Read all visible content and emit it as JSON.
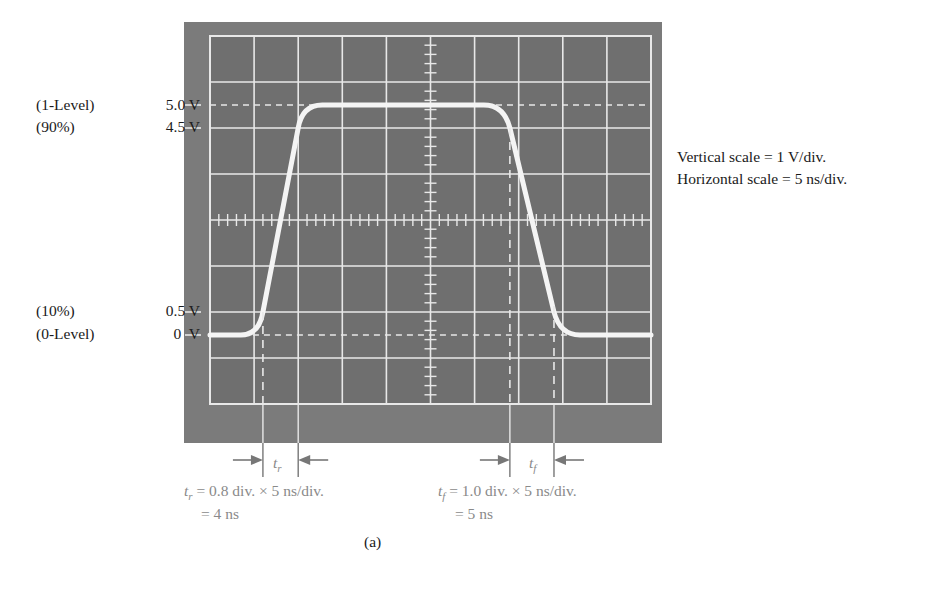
{
  "figure": {
    "caption": "(a)",
    "levels": [
      {
        "percent_label": "(1-Level)",
        "voltage_label": "5.0 V",
        "volts": 5.0
      },
      {
        "percent_label": "(90%)",
        "voltage_label": "4.5 V",
        "volts": 4.5
      },
      {
        "percent_label": "(10%)",
        "voltage_label": "0.5 V",
        "volts": 0.5
      },
      {
        "percent_label": "(0-Level)",
        "voltage_label": "0  V",
        "volts": 0
      }
    ],
    "scale_notes": {
      "vertical": "Vertical scale = 1 V/div.",
      "horizontal": "Horizontal scale = 5 ns/div."
    },
    "rise": {
      "symbol": "t",
      "subscript": "r",
      "formula": "= 0.8 div. × 5 ns/div.",
      "result": "= 4 ns",
      "start_div": 1.2,
      "end_div": 2.0
    },
    "fall": {
      "symbol": "t",
      "subscript": "f",
      "formula": "= 1.0 div. × 5 ns/div.",
      "result": "= 5 ns",
      "start_div": 6.8,
      "end_div": 7.8
    },
    "scope": {
      "h_divisions": 10,
      "v_divisions": 8,
      "volts_per_div": 1,
      "ns_per_div": 5,
      "minor_ticks_per_div": 5,
      "zero_level_div_from_bottom": 1.5,
      "colors": {
        "bezel": "#7b7b7b",
        "screen": "#6f6f6f",
        "grid": "#e8e8e8",
        "trace": "#f4f4f4",
        "marker": "#bdbdbd"
      }
    }
  }
}
